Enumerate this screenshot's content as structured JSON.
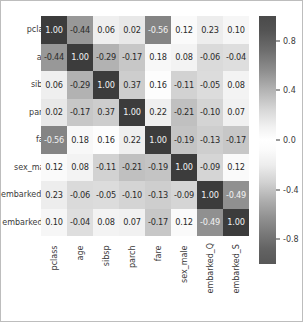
{
  "chart_data": {
    "type": "heatmap",
    "title": "",
    "xlabel": "",
    "ylabel": "",
    "grid": false,
    "legend_position": "right",
    "colorbar": {
      "ticks": [
        "0.8",
        "0.4",
        "0.0",
        "-0.4",
        "-0.8"
      ],
      "tick_values": [
        0.8,
        0.4,
        0.0,
        -0.4,
        -0.8
      ],
      "vmin": -1.0,
      "vmax": 1.0,
      "colormap": "diverging-gray"
    },
    "x_categories": [
      "pclass",
      "age",
      "sibsp",
      "parch",
      "fare",
      "sex_male",
      "embarked_Q",
      "embarked_S"
    ],
    "y_categories": [
      "pclass",
      "age",
      "sibsp",
      "parch",
      "fare",
      "sex_male",
      "embarked_Q",
      "embarked_S"
    ],
    "annotation_format": "0.00",
    "values": [
      [
        1.0,
        -0.44,
        0.06,
        0.02,
        -0.56,
        0.12,
        0.23,
        0.1
      ],
      [
        -0.44,
        1.0,
        -0.29,
        -0.17,
        0.18,
        0.08,
        -0.06,
        -0.04
      ],
      [
        0.06,
        -0.29,
        1.0,
        0.37,
        0.16,
        -0.11,
        -0.05,
        0.08
      ],
      [
        0.02,
        -0.17,
        0.37,
        1.0,
        0.22,
        -0.21,
        -0.1,
        0.07
      ],
      [
        -0.56,
        0.18,
        0.16,
        0.22,
        1.0,
        -0.19,
        -0.13,
        -0.17
      ],
      [
        0.12,
        0.08,
        -0.11,
        -0.21,
        -0.19,
        1.0,
        -0.09,
        0.12
      ],
      [
        0.23,
        -0.06,
        -0.05,
        -0.1,
        -0.13,
        -0.09,
        1.0,
        -0.49
      ],
      [
        0.1,
        -0.04,
        0.08,
        0.07,
        -0.17,
        0.12,
        -0.49,
        1.0
      ]
    ],
    "labels": [
      [
        "1.00",
        "-0.44",
        "0.06",
        "0.02",
        "-0.56",
        "0.12",
        "0.23",
        "0.10"
      ],
      [
        "-0.44",
        "1.00",
        "-0.29",
        "-0.17",
        "0.18",
        "0.08",
        "-0.06",
        "-0.04"
      ],
      [
        "0.06",
        "-0.29",
        "1.00",
        "0.37",
        "0.16",
        "-0.11",
        "-0.05",
        "0.08"
      ],
      [
        "0.02",
        "-0.17",
        "0.37",
        "1.00",
        "0.22",
        "-0.21",
        "-0.10",
        "0.07"
      ],
      [
        "-0.56",
        "0.18",
        "0.16",
        "0.22",
        "1.00",
        "-0.19",
        "-0.13",
        "-0.17"
      ],
      [
        "0.12",
        "0.08",
        "-0.11",
        "-0.21",
        "-0.19",
        "1.00",
        "-0.09",
        "0.12"
      ],
      [
        "0.23",
        "-0.06",
        "-0.05",
        "-0.10",
        "-0.13",
        "-0.09",
        "1.00",
        "-0.49"
      ],
      [
        "0.10",
        "-0.04",
        "0.08",
        "0.07",
        "-0.17",
        "0.12",
        "-0.49",
        "1.00"
      ]
    ]
  },
  "colors": {
    "figure_background": "#ffffff",
    "border": "#bdbdbd",
    "text": "#3a3a3a",
    "annotation_dark_cell_text": "#f2f2f2",
    "annotation_light_cell_text": "#2b2b2b"
  }
}
